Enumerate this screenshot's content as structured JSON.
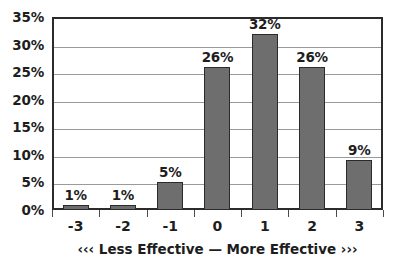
{
  "chart_data": {
    "type": "bar",
    "title": "",
    "xlabel": "‹‹‹ Less Effective — More Effective ›››",
    "ylabel": "",
    "categories": [
      "-3",
      "-2",
      "-1",
      "0",
      "1",
      "2",
      "3"
    ],
    "values": [
      1,
      1,
      5,
      26,
      32,
      26,
      9
    ],
    "value_labels": [
      "1%",
      "1%",
      "5%",
      "26%",
      "32%",
      "26%",
      "9%"
    ],
    "ylim": [
      0,
      35
    ],
    "ytick_values": [
      0,
      5,
      10,
      15,
      20,
      25,
      30,
      35
    ],
    "ytick_labels": [
      "0%",
      "5%",
      "10%",
      "15%",
      "20%",
      "25%",
      "30%",
      "35%"
    ],
    "grid": true,
    "legend": "none",
    "series": [
      {
        "name": "Percent of responses",
        "values": [
          1,
          1,
          5,
          26,
          32,
          26,
          9
        ]
      }
    ],
    "colors": {
      "bar_fill": "#6e6e6e",
      "bar_outline": "#2b2b2b",
      "gridline": "#9a9a9a",
      "plot_border": "#2b2b2b",
      "text": "#1d1d1d",
      "background": "#ffffff"
    }
  }
}
